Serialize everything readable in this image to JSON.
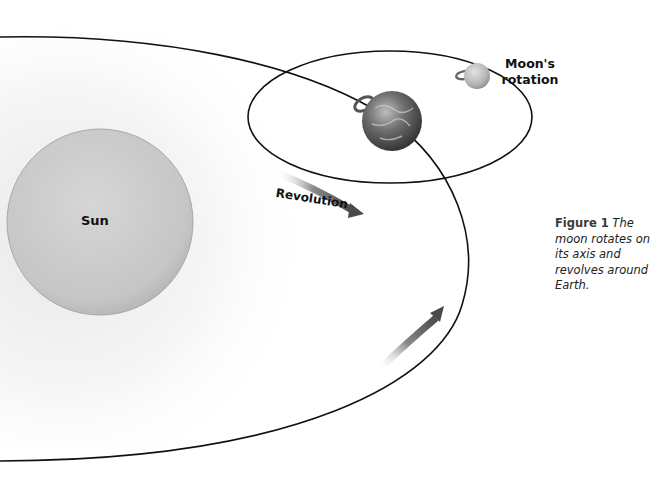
{
  "figure": {
    "number": "Figure 1",
    "caption": "The moon rotates on its axis and revolves around Earth."
  },
  "labels": {
    "sun": "Sun",
    "moon_rotation_line1": "Moon's",
    "moon_rotation_line2": "rotation",
    "revolution": "Revolution"
  },
  "colors": {
    "orbit_line": "#111111",
    "sun_fill": "#c9c9c9",
    "arrow": "#555555",
    "earth": "#5a5a5a",
    "moon": "#bdbdbd"
  }
}
